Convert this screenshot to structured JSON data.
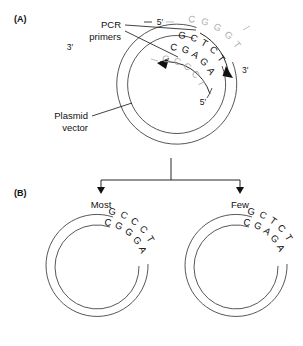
{
  "figure": {
    "background_color": "#ffffff",
    "line_color": "#111111",
    "circle_color": "#444444",
    "muted_color": "#b0b0b0"
  },
  "panel_a": {
    "label": "(A)",
    "callouts": [
      {
        "name": "pcr-primers",
        "line1": "PCR",
        "line2": "primers"
      },
      {
        "name": "plasmid-vector",
        "line1": "Plasmid",
        "line2": "vector"
      }
    ],
    "end_labels": {
      "template_three_prime_left": "3′",
      "primer_five_prime_top": "5′",
      "primer_three_prime_right": "3′",
      "primer_five_prime_inner": "5′"
    },
    "strands": [
      {
        "name": "template-top-strand",
        "style": "grey",
        "bases": [
          "C",
          "G",
          "G",
          "G",
          "T"
        ]
      },
      {
        "name": "primer-top-strand",
        "style": "dark",
        "bases": [
          "G",
          "C",
          "T",
          "C",
          "T"
        ]
      },
      {
        "name": "primer-bottom-strand",
        "style": "dark",
        "bases": [
          "C",
          "G",
          "A",
          "G",
          "A"
        ]
      },
      {
        "name": "template-bottom-strand",
        "style": "grey",
        "bases": [
          "G",
          "C",
          "C",
          "C",
          "T"
        ]
      }
    ]
  },
  "panel_b": {
    "label": "(B)",
    "branches": [
      {
        "name": "most",
        "label": "Most",
        "plasmid": {
          "top_strand": [
            "G",
            "C",
            "C",
            "C",
            "T"
          ],
          "bottom_strand": [
            "C",
            "G",
            "G",
            "G",
            "A"
          ]
        }
      },
      {
        "name": "few",
        "label": "Few",
        "plasmid": {
          "top_strand": [
            "G",
            "C",
            "T",
            "C",
            "T"
          ],
          "bottom_strand": [
            "C",
            "G",
            "A",
            "G",
            "A"
          ]
        }
      }
    ]
  }
}
